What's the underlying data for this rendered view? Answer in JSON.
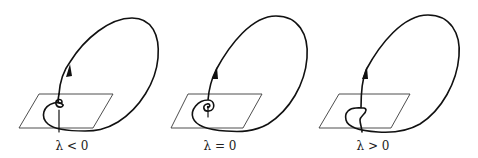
{
  "figure": {
    "colors": {
      "curve": "#111111",
      "plane": "#3a3a3a",
      "background": "#ffffff"
    },
    "panels": [
      {
        "id": "lambda-negative",
        "label": "λ < 0",
        "local_behavior": "orbit returns and misses equilibrium (twist above plane)"
      },
      {
        "id": "lambda-zero",
        "label": "λ = 0",
        "local_behavior": "orbit spirals into equilibrium (homoclinic connection)"
      },
      {
        "id": "lambda-positive",
        "label": "λ > 0",
        "local_behavior": "orbit returns and misses equilibrium (S-turn below)"
      }
    ]
  }
}
